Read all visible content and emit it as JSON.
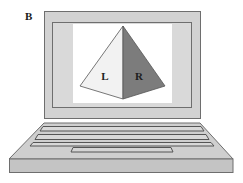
{
  "panel": {
    "label": "B"
  },
  "laptop": {
    "bezel_color": "#d2d2d2",
    "outline_color": "#6e6e6e",
    "screen_color": "#ffffff",
    "base_color": "#cfcfcf",
    "front_edge_color": "#c4c4c4"
  },
  "pyramid": {
    "faces": [
      {
        "id": "left",
        "label": "L",
        "color": "#f2f2f2"
      },
      {
        "id": "right",
        "label": "R",
        "color": "#7c7c7c"
      }
    ]
  }
}
